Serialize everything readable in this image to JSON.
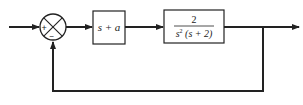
{
  "diagram": {
    "type": "feedback-control-block-diagram",
    "summing_junction": {
      "signs": {
        "top_left": "+",
        "bottom": "−"
      }
    },
    "blocks": [
      {
        "id": "controller",
        "label": "s + a"
      },
      {
        "id": "plant",
        "numerator": "2",
        "denominator_base": "s",
        "denominator_exp": "2",
        "denominator_rest": " (s + 2)"
      }
    ],
    "connections": [
      {
        "from": "input",
        "to": "summing_junction",
        "sign": "+"
      },
      {
        "from": "summing_junction",
        "to": "controller"
      },
      {
        "from": "controller",
        "to": "plant"
      },
      {
        "from": "plant",
        "to": "output"
      },
      {
        "from": "output",
        "to": "summing_junction",
        "sign": "−",
        "type": "unity-feedback"
      }
    ],
    "colors": {
      "line": "#222222",
      "background": "#ffffff"
    }
  }
}
